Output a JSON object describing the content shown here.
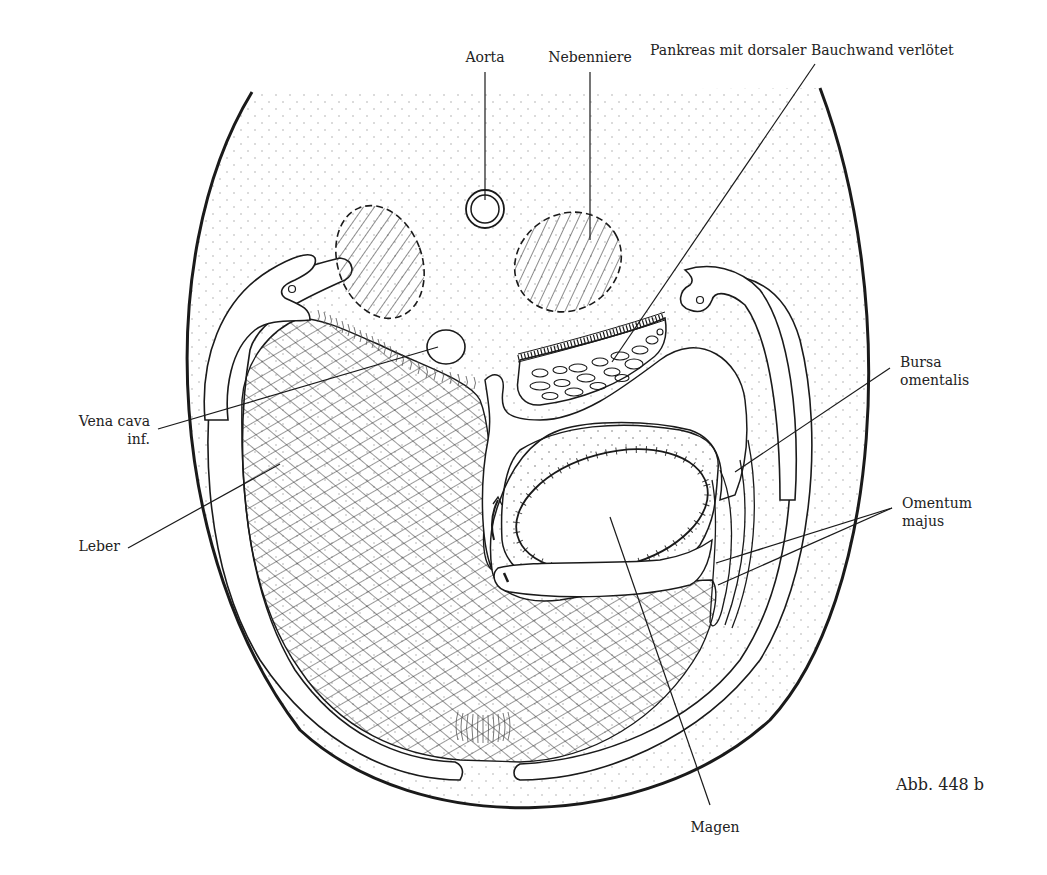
{
  "figure": {
    "caption": "Abb. 448 b"
  },
  "labels": {
    "aorta": "Aorta",
    "nebenniere": "Nebenniere",
    "pankreas": "Pankreas mit dorsaler Bauchwand verlötet",
    "vena_cava_line1": "Vena cava",
    "vena_cava_line2": "inf.",
    "leber": "Leber",
    "bursa_line1": "Bursa",
    "bursa_line2": "omentalis",
    "omentum_line1": "Omentum",
    "omentum_line2": "majus",
    "magen": "Magen"
  },
  "colors": {
    "ink": "#1a1a1a",
    "paper": "#ffffff",
    "stipple": "#9a9a9a"
  }
}
